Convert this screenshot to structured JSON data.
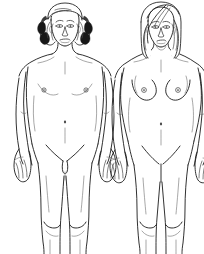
{
  "image": {
    "kind": "line-art-anatomical-illustration",
    "subject": "two nude standing human figures, front view",
    "style": "black ink line drawing on white background",
    "background_color": "#ffffff",
    "line_color": "#1a1a1a",
    "shading_color": "#171717",
    "width": 204,
    "height": 254,
    "crop_note": "figures cropped at the shins/ankles by the lower image edge"
  },
  "figures": [
    {
      "id": "figure-male",
      "label": "male figure",
      "position": "left",
      "pose": "standing upright, frontal view, arms hanging at the sides",
      "hair": {
        "style": "short wavy curled hair",
        "description": "volume of curls framing both sides of the face with dark inked ringlets",
        "color": "#171717"
      },
      "face": {
        "features": [
          "eyebrows",
          "eyes",
          "nose",
          "mouth",
          "chin"
        ],
        "expression": "neutral"
      },
      "chest": {
        "type": "flat male chest",
        "nipples": 2
      },
      "torso_marks": [
        "navel",
        "collarbone",
        "sternum line"
      ],
      "limbs": {
        "arms": 2,
        "hands": 2,
        "fingers_visible": true,
        "legs": 2,
        "knees_outlined": true
      }
    },
    {
      "id": "figure-female",
      "label": "female figure",
      "position": "right",
      "pose": "standing upright, frontal view, arms hanging at the sides",
      "hair": {
        "style": "long straight hair with a side part",
        "description": "hair falls past the shoulders on both sides of the face",
        "color": "#3d3d3d"
      },
      "face": {
        "features": [
          "eyebrows",
          "eyes",
          "nose",
          "mouth",
          "chin"
        ],
        "expression": "neutral"
      },
      "chest": {
        "type": "female breasts",
        "nipples": 2
      },
      "torso_marks": [
        "navel",
        "collarbone",
        "sternum line"
      ],
      "limbs": {
        "arms": 2,
        "hands": 2,
        "fingers_visible": true,
        "legs": 2,
        "knees_outlined": true
      }
    }
  ]
}
